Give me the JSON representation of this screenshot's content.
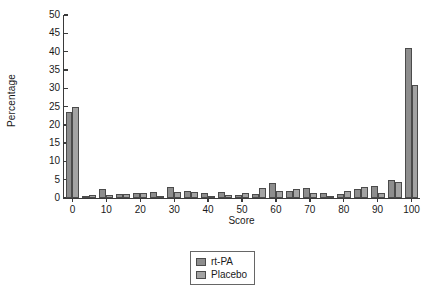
{
  "chart_data": {
    "type": "bar",
    "title": "",
    "subtitle": "",
    "xlabel": "Score",
    "ylabel": "Percentage",
    "xlim": [
      -2.5,
      102.5
    ],
    "ylim": [
      0,
      50
    ],
    "ytick_values": [
      0,
      5,
      10,
      15,
      20,
      25,
      30,
      35,
      40,
      45,
      50
    ],
    "ytick_labels": [
      "0",
      "5",
      "10",
      "15",
      "20",
      "25",
      "30",
      "35",
      "40",
      "45",
      "50"
    ],
    "xtick_values": [
      0,
      10,
      20,
      30,
      40,
      50,
      60,
      70,
      80,
      90,
      100
    ],
    "xtick_labels": [
      "0",
      "10",
      "20",
      "30",
      "40",
      "50",
      "60",
      "70",
      "80",
      "90",
      "100"
    ],
    "grid": false,
    "legend_position": "bottom-center",
    "categories": [
      0,
      5,
      10,
      15,
      20,
      25,
      30,
      35,
      40,
      45,
      50,
      55,
      60,
      65,
      70,
      75,
      80,
      85,
      90,
      95,
      100
    ],
    "series": [
      {
        "name": "rt-PA",
        "color": "#8d8d8d",
        "values": [
          23.5,
          0.4,
          2.5,
          1.0,
          1.5,
          1.6,
          3.0,
          1.9,
          1.5,
          1.7,
          0.9,
          1.2,
          4.0,
          2.0,
          2.6,
          1.5,
          1.2,
          2.4,
          3.4,
          5.0,
          41.0
        ]
      },
      {
        "name": "Placebo",
        "color": "#a3a3a3",
        "values": [
          25.0,
          0.8,
          0.9,
          1.0,
          1.4,
          0.6,
          1.6,
          1.7,
          0.5,
          0.9,
          1.5,
          2.6,
          2.0,
          2.5,
          1.3,
          0.6,
          1.8,
          3.0,
          1.5,
          4.4,
          31.0
        ]
      }
    ],
    "legend": [
      {
        "label": "rt-PA",
        "swatch": "#8d8d8d"
      },
      {
        "label": "Placebo",
        "swatch": "#a3a3a3"
      }
    ]
  }
}
